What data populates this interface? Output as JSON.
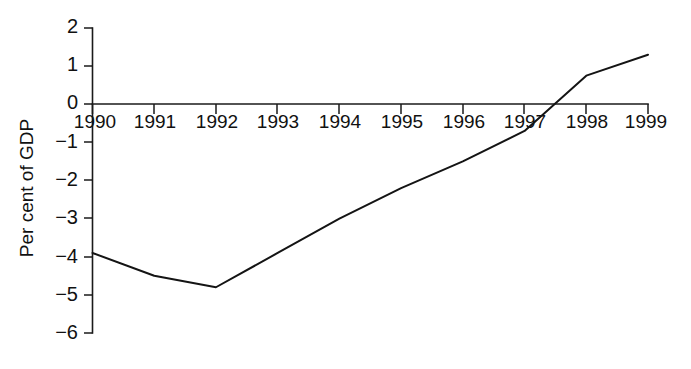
{
  "chart_data": {
    "type": "line",
    "title": "",
    "subtitle": "",
    "xlabel": "",
    "ylabel": "Per cent of GDP",
    "x": [
      1990,
      1991,
      1992,
      1993,
      1994,
      1995,
      1996,
      1997,
      1998,
      1999
    ],
    "categories": [
      "1990",
      "1991",
      "1992",
      "1993",
      "1994",
      "1995",
      "1996",
      "1997",
      "1998",
      "1999"
    ],
    "values": [
      -3.9,
      -4.5,
      -4.8,
      -3.9,
      -3.0,
      -2.2,
      -1.5,
      -0.7,
      0.75,
      1.3
    ],
    "series": [
      {
        "name": "Per cent of GDP",
        "values": [
          -3.9,
          -4.5,
          -4.8,
          -3.9,
          -3.0,
          -2.2,
          -1.5,
          -0.7,
          0.75,
          1.3
        ]
      }
    ],
    "xlim": [
      1990,
      1999
    ],
    "ylim": [
      -6,
      2
    ],
    "ytick_values": [
      2,
      1,
      0,
      -1,
      -2,
      -3,
      -4,
      -5,
      -6
    ],
    "ytick_labels": [
      "2",
      "1",
      "0",
      "−1",
      "−2",
      "−3",
      "−4",
      "−5",
      "−6"
    ],
    "xtick_values": [
      1990,
      1991,
      1992,
      1993,
      1994,
      1995,
      1996,
      1997,
      1998,
      1999
    ],
    "xtick_labels": [
      "1990",
      "1991",
      "1992",
      "1993",
      "1994",
      "1995",
      "1996",
      "1997",
      "1998",
      "1999"
    ],
    "grid": false,
    "legend": false,
    "legend_position": "none",
    "zero_axis": true,
    "line_color": "#141414",
    "axis_color": "#1a1a1a",
    "background_color": "#ffffff",
    "annotations": []
  }
}
